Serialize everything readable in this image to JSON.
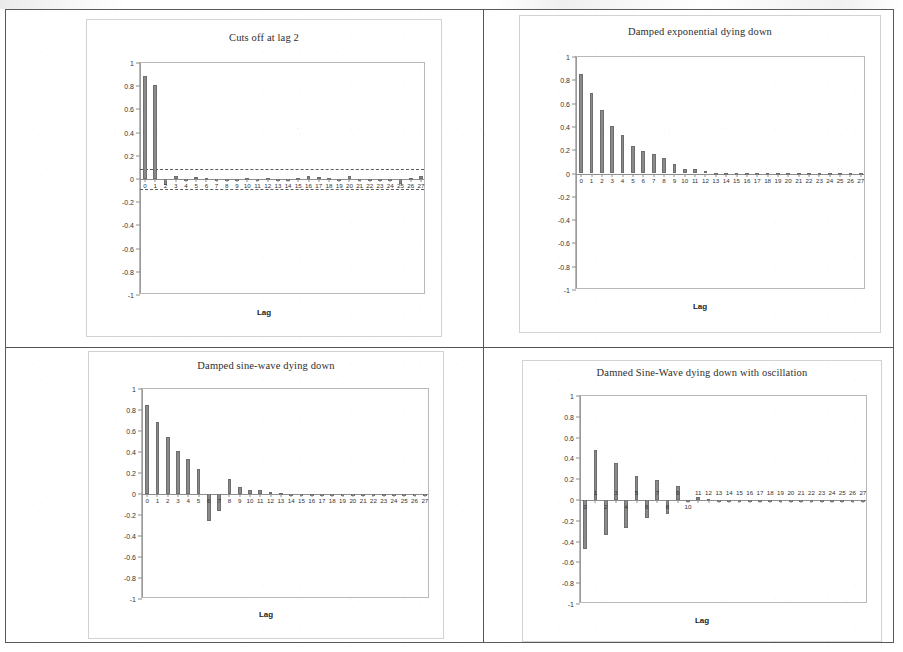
{
  "page": {
    "background_color": "#ffffff",
    "border_color": "#5a5a5a",
    "bar_color": "#8a8a8a",
    "axis_color": "#9a9a9a"
  },
  "panels": [
    {
      "id": "panel-cuts-off-at-lag-2",
      "position": "top-left"
    },
    {
      "id": "panel-damped-exponential",
      "position": "top-right"
    },
    {
      "id": "panel-damped-sine-wave",
      "position": "bottom-left"
    },
    {
      "id": "panel-damped-sine-wave-oscillation",
      "position": "bottom-right"
    }
  ],
  "chart_data": [
    {
      "type": "bar",
      "title": "Cuts off at lag 2",
      "xlabel": "Lag",
      "ylabel": "",
      "ylim": [
        -1,
        1
      ],
      "yticks": [
        "1",
        "0.8",
        "0.6",
        "0.4",
        "0.2",
        "0",
        "-0.2",
        "-0.4",
        "-0.6",
        "-0.8",
        "-1"
      ],
      "ytick_values": [
        1,
        0.8,
        0.6,
        0.4,
        0.2,
        0,
        -0.2,
        -0.4,
        -0.6,
        -0.8,
        -1
      ],
      "categories": [
        "0",
        "1",
        "2",
        "3",
        "4",
        "5",
        "6",
        "7",
        "8",
        "9",
        "10",
        "11",
        "12",
        "13",
        "14",
        "15",
        "16",
        "17",
        "18",
        "19",
        "20",
        "21",
        "22",
        "23",
        "24",
        "25",
        "26",
        "27"
      ],
      "values": [
        0.89,
        0.81,
        -0.05,
        0.03,
        -0.015,
        0.02,
        0.005,
        -0.005,
        -0.012,
        0.004,
        0.006,
        -0.008,
        0.005,
        -0.004,
        0.003,
        0.008,
        0.025,
        0.018,
        0.006,
        -0.012,
        0.028,
        -0.016,
        0.004,
        -0.006,
        0.004,
        -0.04,
        0.01,
        0.022
      ],
      "confidence_lines": [
        0.09,
        -0.09
      ],
      "grid": false,
      "legend": "none"
    },
    {
      "type": "bar",
      "title": "Damped exponential dying down",
      "xlabel": "Lag",
      "ylabel": "",
      "ylim": [
        -1,
        1
      ],
      "yticks": [
        "1",
        "0.8",
        "0.6",
        "0.4",
        "0.2",
        "0",
        "-0.2",
        "-0.4",
        "-0.6",
        "-0.8",
        "-1"
      ],
      "ytick_values": [
        1,
        0.8,
        0.6,
        0.4,
        0.2,
        0,
        -0.2,
        -0.4,
        -0.6,
        -0.8,
        -1
      ],
      "categories": [
        "0",
        "1",
        "2",
        "3",
        "4",
        "5",
        "6",
        "7",
        "8",
        "9",
        "10",
        "11",
        "12",
        "13",
        "14",
        "15",
        "16",
        "17",
        "18",
        "19",
        "20",
        "21",
        "22",
        "23",
        "24",
        "25",
        "26",
        "27"
      ],
      "values": [
        0.85,
        0.69,
        0.545,
        0.41,
        0.33,
        0.24,
        0.195,
        0.17,
        0.135,
        0.08,
        0.04,
        0.038,
        0.02,
        0.008,
        0.004,
        0.003,
        0.002,
        0.002,
        0.001,
        0.001,
        0.001,
        0.001,
        0.001,
        0.001,
        0.001,
        0.001,
        0.001,
        0.001
      ],
      "confidence_lines": [],
      "grid": false,
      "legend": "none"
    },
    {
      "type": "bar",
      "title": "Damped sine-wave dying down",
      "xlabel": "Lag",
      "ylabel": "",
      "ylim": [
        -1,
        1
      ],
      "yticks": [
        "1",
        "0.8",
        "0.6",
        "0.4",
        "0.2",
        "0",
        "-0.2",
        "-0.4",
        "-0.6",
        "-0.8",
        "-1"
      ],
      "ytick_values": [
        1,
        0.8,
        0.6,
        0.4,
        0.2,
        0,
        -0.2,
        -0.4,
        -0.6,
        -0.8,
        -1
      ],
      "categories": [
        "0",
        "1",
        "2",
        "3",
        "4",
        "5",
        "6",
        "7",
        "8",
        "9",
        "10",
        "11",
        "12",
        "13",
        "14",
        "15",
        "16",
        "17",
        "18",
        "19",
        "20",
        "21",
        "22",
        "23",
        "24",
        "25",
        "26",
        "27"
      ],
      "values": [
        0.85,
        0.69,
        0.545,
        0.41,
        0.33,
        0.24,
        -0.26,
        -0.16,
        0.14,
        0.07,
        0.04,
        0.04,
        0.02,
        0.012,
        0.004,
        0.003,
        0.002,
        0.002,
        0.001,
        0.001,
        0.001,
        0.001,
        0.001,
        0.001,
        0.001,
        0.001,
        0.001,
        0.001
      ],
      "confidence_lines": [],
      "grid": false,
      "legend": "none"
    },
    {
      "type": "bar",
      "title": "Damned Sine-Wave dying down with oscillation",
      "xlabel": "Lag",
      "ylabel": "",
      "ylim": [
        -1,
        1
      ],
      "yticks": [
        "1",
        "0.8",
        "0.6",
        "0.4",
        "0.2",
        "0",
        "-0.2",
        "-0.4",
        "-0.6",
        "-0.8",
        "-1"
      ],
      "ytick_values": [
        1,
        0.8,
        0.6,
        0.4,
        0.2,
        0,
        -0.2,
        -0.4,
        -0.6,
        -0.8,
        -1
      ],
      "categories": [
        "0",
        "1",
        "2",
        "3",
        "4",
        "5",
        "6",
        "7",
        "8",
        "9",
        "10",
        "11",
        "12",
        "13",
        "14",
        "15",
        "16",
        "17",
        "18",
        "19",
        "20",
        "21",
        "22",
        "23",
        "24",
        "25",
        "26",
        "27"
      ],
      "values": [
        -0.47,
        0.48,
        -0.34,
        0.36,
        -0.27,
        0.23,
        -0.17,
        0.19,
        -0.13,
        0.13,
        -0.02,
        0.03,
        0.012,
        0.004,
        0.003,
        0.002,
        0.002,
        0.001,
        0.001,
        0.001,
        0.001,
        0.001,
        0.001,
        0.001,
        0.001,
        0.001,
        0.001,
        0.001
      ],
      "confidence_lines": [],
      "grid": false,
      "legend": "none"
    }
  ]
}
